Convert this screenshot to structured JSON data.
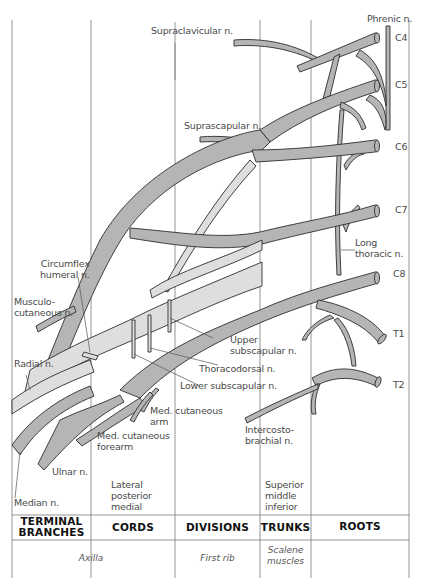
{
  "colors": {
    "nerve_dark": "#b5b5b5",
    "nerve_light": "#dedede",
    "outline": "#2e2e2e",
    "grid": "#7a7a7a",
    "text": "#4a4a4a"
  },
  "roots": [
    "C4",
    "C5",
    "C6",
    "C7",
    "C8",
    "T1",
    "T2"
  ],
  "labels": {
    "phrenic": "Phrenic n.",
    "supraclavicular": "Supraclavicular n.",
    "suprascapular": "Suprascapular n.",
    "long_thoracic": "Long\nthoracic n.",
    "circumflex_humeral": "Circumflex\nhumeral n.",
    "musculocutaneous": "Musculo-\ncutaneous n.",
    "radial": "Radial n.",
    "upper_subscapular": "Upper\nsubscapular n.",
    "thoracodorsal": "Thoracodorsal n.",
    "lower_subscapular": "Lower subscapular n.",
    "med_cutaneous_arm": "Med. cutaneous\narm",
    "med_cutaneous_forearm": "Med. cutaneous\nforearm",
    "intercostobrachial": "Intercosto-\nbrachial n.",
    "ulnar": "Ulnar n.",
    "median": "Median n.",
    "cords_list": "Lateral\nposterior\nmedial",
    "trunks_list": "Superior\nmiddle\ninferior"
  },
  "columns": [
    {
      "header": "TERMINAL\nBRANCHES"
    },
    {
      "header": "CORDS"
    },
    {
      "header": "DIVISIONS"
    },
    {
      "header": "TRUNKS"
    },
    {
      "header": "ROOTS"
    }
  ],
  "footer": {
    "axilla": "Axilla",
    "first_rib": "First rib",
    "scalene": "Scalene\nmuscles"
  }
}
